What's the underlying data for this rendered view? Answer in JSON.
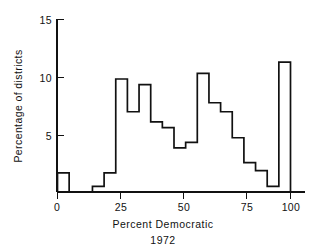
{
  "chart_data": {
    "type": "bar",
    "title": "",
    "xlabel": "Percent Democratic",
    "sublabel": "1972",
    "ylabel": "Percentage of districts",
    "xlim": [
      -2,
      102
    ],
    "ylim": [
      0,
      15
    ],
    "grid": false,
    "legend": null,
    "bin_width": 5,
    "xticks": [
      0,
      25,
      50,
      75,
      100
    ],
    "xtick_labels": [
      "0",
      "25",
      "50",
      "75",
      "100"
    ],
    "yticks": [
      5,
      10,
      15
    ],
    "ytick_labels": [
      "5",
      "10",
      "15"
    ],
    "bin_edges": [
      0,
      5,
      10,
      15,
      20,
      25,
      30,
      35,
      40,
      45,
      50,
      55,
      60,
      65,
      70,
      75,
      80,
      85,
      90,
      95,
      100
    ],
    "categories": [
      "0-5",
      "5-10",
      "10-15",
      "15-20",
      "20-25",
      "25-30",
      "30-35",
      "35-40",
      "40-45",
      "45-50",
      "50-55",
      "55-60",
      "60-65",
      "65-70",
      "70-75",
      "75-80",
      "80-85",
      "85-90",
      "90-95",
      "95-100"
    ],
    "values": [
      1.7,
      0,
      0,
      0.5,
      1.7,
      10.0,
      7.1,
      9.5,
      6.2,
      5.7,
      3.9,
      4.4,
      10.5,
      7.9,
      7.1,
      4.8,
      2.6,
      1.9,
      0.5,
      11.5
    ],
    "line_color": "#111111",
    "fill_color": "none",
    "background_color": "#ffffff"
  },
  "axes": {
    "x_title": "Percent Democratic",
    "x_subtitle": "1972",
    "y_title": "Percentage of districts"
  }
}
